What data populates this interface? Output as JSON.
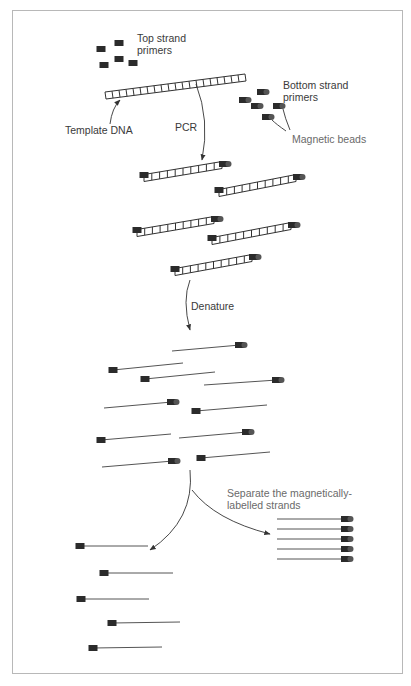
{
  "diagram": {
    "labels": {
      "top_primers": "Top strand\nprimers",
      "bottom_primers": "Bottom strand\nprimers",
      "template": "Template DNA",
      "magnetic_beads": "Magnetic beads",
      "pcr": "PCR",
      "denature": "Denature",
      "separate": "Separate the magnetically-\nlabelled strands"
    },
    "colors": {
      "primer": "#2b2b2b",
      "bead": "#4a4a4a",
      "strand": "#555555",
      "text": "#3a3a3a",
      "frame": "#b8b8b8"
    },
    "stages": [
      {
        "name": "reagents",
        "items": [
          "5 top strand primers",
          "5 bottom strand primers with magnetic beads",
          "template DNA"
        ]
      },
      {
        "name": "pcr_products",
        "count": 5,
        "description": "double-stranded DNA with primer on left and bead on right"
      },
      {
        "name": "denatured_strands",
        "count": 10,
        "description": "single strands, half bead-labelled, half primer-labelled"
      },
      {
        "name": "separated_bead_strands",
        "count": 5
      },
      {
        "name": "remaining_unlabelled_strands",
        "count": 5
      }
    ]
  }
}
